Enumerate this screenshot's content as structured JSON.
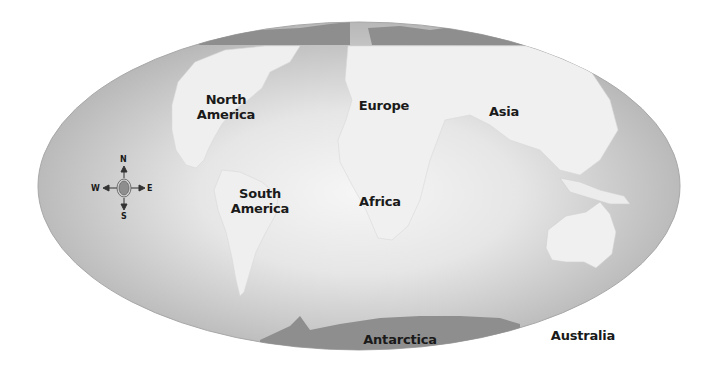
{
  "map": {
    "projection": "oval world map",
    "colors": {
      "ocean_edge": "#b4b4b4",
      "ocean_center": "#f4f4f4",
      "land": "#efefef",
      "polar_land": "#8e8e8e",
      "label": "#1a1a1a"
    },
    "continents": [
      {
        "name": "North America",
        "line1": "North",
        "line2": "America"
      },
      {
        "name": "South America",
        "line1": "South",
        "line2": "America"
      },
      {
        "name": "Europe",
        "line1": "Europe"
      },
      {
        "name": "Asia",
        "line1": "Asia"
      },
      {
        "name": "Africa",
        "line1": "Africa"
      },
      {
        "name": "Australia",
        "line1": "Australia"
      },
      {
        "name": "Antarctica",
        "line1": "Antarctica"
      }
    ],
    "compass": {
      "n": "N",
      "s": "S",
      "e": "E",
      "w": "W"
    }
  }
}
